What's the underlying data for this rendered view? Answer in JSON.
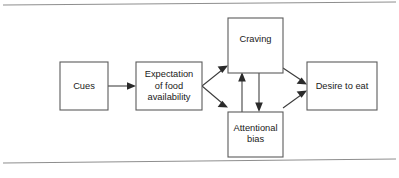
{
  "figure": {
    "type": "flow-diagram",
    "title": "",
    "background_color": "#ffffff",
    "border_color": "#8e8e8e",
    "box_stroke_color": "#5b5b5b",
    "arrow_color": "#2b2b2b",
    "text_color": "#1a1a1a"
  },
  "nodes": [
    {
      "id": "cues",
      "label": "Cues",
      "lines": [
        "Cues"
      ],
      "x": 60,
      "y": 62,
      "width": 48,
      "height": 48
    },
    {
      "id": "expectation",
      "label": "Expectation of food availability",
      "lines": [
        "Expectation",
        "of food",
        "availability"
      ],
      "x": 136,
      "y": 62,
      "width": 66,
      "height": 48
    },
    {
      "id": "craving",
      "label": "Craving",
      "lines": [
        "Craving"
      ],
      "x": 228,
      "y": 18,
      "width": 55,
      "height": 55
    },
    {
      "id": "attentional-bias",
      "label": "Attentional bias",
      "lines": [
        "Attentional",
        "bias"
      ],
      "x": 228,
      "y": 112,
      "width": 55,
      "height": 45
    },
    {
      "id": "desire-to-eat",
      "label": "Desire to eat",
      "lines": [
        "Desire to eat"
      ],
      "x": 307,
      "y": 62,
      "width": 70,
      "height": 48
    }
  ],
  "edges": [
    {
      "id": "cues-to-expectation",
      "from": "cues",
      "to": "expectation",
      "direction": "right"
    },
    {
      "id": "expectation-to-craving",
      "from": "expectation",
      "to": "craving",
      "direction": "up-right"
    },
    {
      "id": "expectation-to-attentional-bias",
      "from": "expectation",
      "to": "attentional-bias",
      "direction": "down-right"
    },
    {
      "id": "attentional-bias-to-craving",
      "from": "attentional-bias",
      "to": "craving",
      "direction": "up"
    },
    {
      "id": "craving-to-attentional-bias",
      "from": "craving",
      "to": "attentional-bias",
      "direction": "down"
    },
    {
      "id": "craving-to-desire",
      "from": "craving",
      "to": "desire-to-eat",
      "direction": "down-right"
    },
    {
      "id": "attentional-bias-to-desire",
      "from": "attentional-bias",
      "to": "desire-to-eat",
      "direction": "up-right"
    }
  ],
  "rules": [
    {
      "id": "top-rule",
      "x1": 3,
      "y1": 5,
      "x2": 396,
      "y2": 2
    },
    {
      "id": "bottom-rule",
      "x1": 3,
      "y1": 163,
      "x2": 396,
      "y2": 159
    }
  ]
}
